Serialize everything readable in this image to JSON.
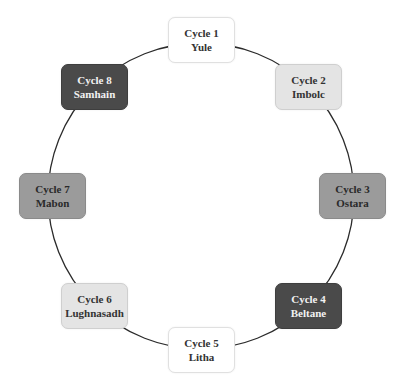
{
  "diagram": {
    "type": "cycle",
    "ring": {
      "cx": 201,
      "cy": 196,
      "r": 153,
      "stroke": "#2b2b2b"
    },
    "nodes": [
      {
        "cycle": "Cycle 1",
        "name": "Yule",
        "shade": "white",
        "fill": "#ffffff",
        "cx": 201,
        "cy": 40
      },
      {
        "cycle": "Cycle 2",
        "name": "Imbolc",
        "shade": "light",
        "fill": "#e4e4e4",
        "cx": 308,
        "cy": 87
      },
      {
        "cycle": "Cycle 3",
        "name": "Ostara",
        "shade": "mid",
        "fill": "#9b9b9b",
        "cx": 352,
        "cy": 196
      },
      {
        "cycle": "Cycle 4",
        "name": "Beltane",
        "shade": "dark",
        "fill": "#4a4a4a",
        "cx": 308,
        "cy": 306
      },
      {
        "cycle": "Cycle 5",
        "name": "Litha",
        "shade": "white",
        "fill": "#ffffff",
        "cx": 201,
        "cy": 350
      },
      {
        "cycle": "Cycle 6",
        "name": "Lughnasadh",
        "shade": "light",
        "fill": "#e4e4e4",
        "cx": 94,
        "cy": 306
      },
      {
        "cycle": "Cycle 7",
        "name": "Mabon",
        "shade": "mid",
        "fill": "#9b9b9b",
        "cx": 53,
        "cy": 196
      },
      {
        "cycle": "Cycle 8",
        "name": "Samhain",
        "shade": "dark",
        "fill": "#4a4a4a",
        "cx": 94,
        "cy": 87
      }
    ]
  }
}
